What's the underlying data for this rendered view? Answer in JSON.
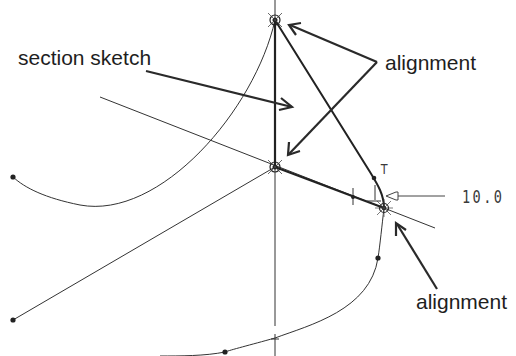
{
  "diagram": {
    "type": "cad-sketch",
    "labels": {
      "section_sketch": "section sketch",
      "alignment_top": "alignment",
      "alignment_bottom": "alignment",
      "dimension_value": "10.0",
      "tangent_marker": "T"
    },
    "points": {
      "top_alignment": [
        275,
        20
      ],
      "center_alignment": [
        275,
        167
      ],
      "right_alignment": [
        384,
        208
      ]
    },
    "colors": {
      "background": "#ffffff",
      "stroke": "#2a2a2a",
      "text": "#1e1e1e"
    }
  }
}
